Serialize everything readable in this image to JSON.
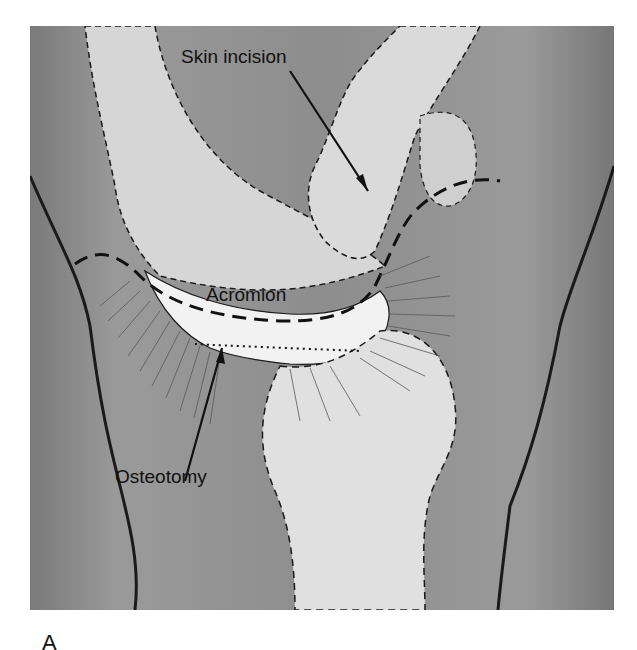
{
  "figure": {
    "panel_letter": "A",
    "labels": {
      "skin_incision": "Skin incision",
      "acromion": "Acromion",
      "osteotomy": "Osteotomy"
    },
    "colors": {
      "background": "#8f8f8f",
      "bone": "#dcdcdc",
      "bone_light": "#eeeeee",
      "outline": "#1a1a1a"
    }
  }
}
